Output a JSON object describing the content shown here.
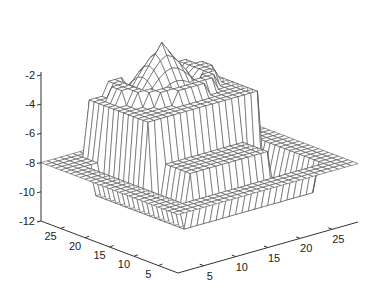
{
  "chart_data": {
    "type": "surface",
    "title": "",
    "xlabel": "",
    "ylabel": "",
    "zlabel": "",
    "x_ticks": [
      5,
      10,
      15,
      20,
      25
    ],
    "y_ticks": [
      5,
      10,
      15,
      20,
      25
    ],
    "z_ticks": [
      -2,
      -4,
      -6,
      -8,
      -10,
      -12
    ],
    "xlim": [
      1,
      29
    ],
    "ylim": [
      1,
      29
    ],
    "zlim": [
      -12,
      -2
    ],
    "grid_size": 29,
    "style": "wireframe mesh, hidden surfaces, white faces with dark edges",
    "levels": {
      "outer_plateau": -8,
      "sunken_ring": -10,
      "central_floor": -7.2,
      "raised_plateau": -4.2,
      "peak_max": -1
    },
    "peak_location": {
      "x": 16,
      "y": 24
    }
  },
  "axes": {
    "z_labels": [
      "-2",
      "-4",
      "-6",
      "-8",
      "-10",
      "-12"
    ],
    "y_labels": [
      "25",
      "20",
      "15",
      "10",
      "5"
    ],
    "x_labels": [
      "5",
      "10",
      "15",
      "20",
      "25"
    ]
  },
  "colors": {
    "background": "#ffffff",
    "mesh_edge": "#444444",
    "mesh_face": "#ffffff",
    "axis": "#333333"
  }
}
